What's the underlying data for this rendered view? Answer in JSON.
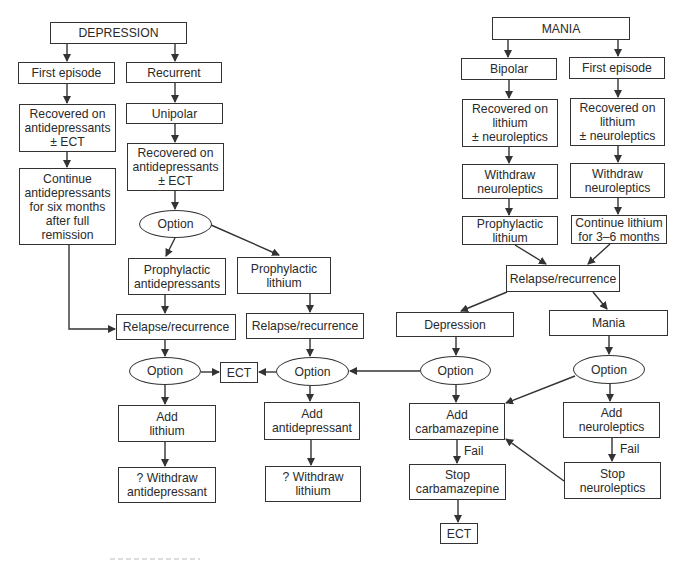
{
  "diagram": {
    "type": "flowchart",
    "nodes": {
      "depression": {
        "label": "DEPRESSION",
        "x": 50,
        "y": 22,
        "w": 137,
        "h": 22,
        "shape": "rect"
      },
      "dep_first_episode": {
        "label": "First episode",
        "x": 18,
        "y": 62,
        "w": 97,
        "h": 22,
        "shape": "rect"
      },
      "dep_recurrent": {
        "label": "Recurrent",
        "x": 126,
        "y": 62,
        "w": 96,
        "h": 21,
        "shape": "rect"
      },
      "dep_recovered_first": {
        "label": "Recovered on\nantidepressants\n± ECT",
        "x": 19,
        "y": 104,
        "w": 97,
        "h": 48,
        "shape": "rect"
      },
      "dep_unipolar": {
        "label": "Unipolar",
        "x": 126,
        "y": 103,
        "w": 97,
        "h": 21,
        "shape": "rect"
      },
      "dep_continue": {
        "label": "Continue\nantidepressants\nfor six months\nafter full\nremission",
        "x": 19,
        "y": 168,
        "w": 97,
        "h": 77,
        "shape": "rect"
      },
      "dep_recovered_recurrent": {
        "label": "Recovered on\nantidepressants\n± ECT",
        "x": 127,
        "y": 143,
        "w": 97,
        "h": 48,
        "shape": "rect"
      },
      "option_1": {
        "label": "Option",
        "x": 139,
        "y": 210,
        "w": 73,
        "h": 27,
        "shape": "ellipse"
      },
      "prophylactic_antidepressants": {
        "label": "Prophylactic\nantidepressants",
        "x": 128,
        "y": 258,
        "w": 98,
        "h": 37,
        "shape": "rect"
      },
      "prophylactic_lithium_dep": {
        "label": "Prophylactic\nlithium",
        "x": 237,
        "y": 257,
        "w": 94,
        "h": 37,
        "shape": "rect"
      },
      "relapse_left": {
        "label": "Relapse/recurrence",
        "x": 116,
        "y": 314,
        "w": 120,
        "h": 26,
        "shape": "rect"
      },
      "relapse_middle": {
        "label": "Relapse/recurrence",
        "x": 246,
        "y": 313,
        "w": 118,
        "h": 26,
        "shape": "rect"
      },
      "option_left": {
        "label": "Option",
        "x": 129,
        "y": 357,
        "w": 72,
        "h": 28,
        "shape": "ellipse"
      },
      "ect_middle": {
        "label": "ECT",
        "x": 220,
        "y": 362,
        "w": 38,
        "h": 21,
        "shape": "rect"
      },
      "option_middle": {
        "label": "Option",
        "x": 276,
        "y": 357,
        "w": 73,
        "h": 29,
        "shape": "ellipse"
      },
      "add_lithium": {
        "label": "Add\nlithium",
        "x": 118,
        "y": 405,
        "w": 98,
        "h": 37,
        "shape": "rect"
      },
      "add_antidepressant": {
        "label": "Add\nantidepressant",
        "x": 264,
        "y": 402,
        "w": 96,
        "h": 38,
        "shape": "rect"
      },
      "withdraw_antidepressant": {
        "label": "? Withdraw\nantidepressant",
        "x": 118,
        "y": 467,
        "w": 98,
        "h": 36,
        "shape": "rect"
      },
      "withdraw_lithium": {
        "label": "? Withdraw\nlithium",
        "x": 265,
        "y": 466,
        "w": 96,
        "h": 36,
        "shape": "rect"
      },
      "mania": {
        "label": "MANIA",
        "x": 492,
        "y": 17,
        "w": 138,
        "h": 23,
        "shape": "rect"
      },
      "mania_bipolar": {
        "label": "Bipolar",
        "x": 461,
        "y": 58,
        "w": 96,
        "h": 22,
        "shape": "rect"
      },
      "mania_first_episode": {
        "label": "First episode",
        "x": 569,
        "y": 57,
        "w": 96,
        "h": 22,
        "shape": "rect"
      },
      "mania_recovered_bipolar": {
        "label": "Recovered on\nlithium\n± neuroleptics",
        "x": 462,
        "y": 99,
        "w": 96,
        "h": 48,
        "shape": "rect"
      },
      "mania_recovered_first": {
        "label": "Recovered on\nlithium\n± neuroleptics",
        "x": 570,
        "y": 98,
        "w": 95,
        "h": 48,
        "shape": "rect"
      },
      "withdraw_neuroleptics_left": {
        "label": "Withdraw\nneuroleptics",
        "x": 462,
        "y": 164,
        "w": 96,
        "h": 35,
        "shape": "rect"
      },
      "withdraw_neuroleptics_right": {
        "label": "Withdraw\nneuroleptics",
        "x": 570,
        "y": 163,
        "w": 95,
        "h": 35,
        "shape": "rect"
      },
      "prophylactic_lithium_mania": {
        "label": "Prophylactic\nlithium",
        "x": 462,
        "y": 216,
        "w": 96,
        "h": 29,
        "shape": "rect"
      },
      "continue_lithium": {
        "label": "Continue lithium\nfor 3–6 months",
        "x": 571,
        "y": 215,
        "w": 96,
        "h": 29,
        "shape": "rect"
      },
      "relapse_right": {
        "label": "Relapse/recurrence",
        "x": 506,
        "y": 265,
        "w": 114,
        "h": 27,
        "shape": "rect"
      },
      "mania_depression": {
        "label": "Depression",
        "x": 396,
        "y": 312,
        "w": 118,
        "h": 25,
        "shape": "rect"
      },
      "mania_mania": {
        "label": "Mania",
        "x": 549,
        "y": 310,
        "w": 119,
        "h": 26,
        "shape": "rect"
      },
      "option_dep": {
        "label": "Option",
        "x": 420,
        "y": 356,
        "w": 71,
        "h": 29,
        "shape": "ellipse"
      },
      "option_mania": {
        "label": "Option",
        "x": 573,
        "y": 355,
        "w": 72,
        "h": 29,
        "shape": "ellipse"
      },
      "add_carbamazepine": {
        "label": "Add\ncarbamazepine",
        "x": 409,
        "y": 403,
        "w": 96,
        "h": 37,
        "shape": "rect"
      },
      "add_neuroleptics": {
        "label": "Add\nneuroleptics",
        "x": 563,
        "y": 402,
        "w": 97,
        "h": 36,
        "shape": "rect"
      },
      "stop_carbamazepine": {
        "label": "Stop\ncarbamazepine",
        "x": 409,
        "y": 464,
        "w": 97,
        "h": 36,
        "shape": "rect"
      },
      "stop_neuroleptics": {
        "label": "Stop\nneuroleptics",
        "x": 564,
        "y": 462,
        "w": 97,
        "h": 37,
        "shape": "rect"
      },
      "ect_bottom": {
        "label": "ECT",
        "x": 440,
        "y": 523,
        "w": 38,
        "h": 21,
        "shape": "rect"
      }
    },
    "edge_labels": {
      "fail_carbamazepine": "Fail",
      "fail_neuroleptics": "Fail"
    },
    "edges": [
      [
        "depression",
        "dep_first_episode"
      ],
      [
        "depression",
        "dep_recurrent"
      ],
      [
        "dep_first_episode",
        "dep_recovered_first"
      ],
      [
        "dep_recovered_first",
        "dep_continue"
      ],
      [
        "dep_continue",
        "relapse_left"
      ],
      [
        "dep_recurrent",
        "dep_unipolar"
      ],
      [
        "dep_unipolar",
        "dep_recovered_recurrent"
      ],
      [
        "dep_recovered_recurrent",
        "option_1"
      ],
      [
        "option_1",
        "prophylactic_antidepressants"
      ],
      [
        "option_1",
        "prophylactic_lithium_dep"
      ],
      [
        "prophylactic_antidepressants",
        "relapse_left"
      ],
      [
        "prophylactic_lithium_dep",
        "relapse_middle"
      ],
      [
        "relapse_left",
        "option_left"
      ],
      [
        "relapse_middle",
        "option_middle"
      ],
      [
        "option_left",
        "ect_middle"
      ],
      [
        "option_middle",
        "ect_middle"
      ],
      [
        "option_left",
        "add_lithium"
      ],
      [
        "add_lithium",
        "withdraw_antidepressant"
      ],
      [
        "option_middle",
        "add_antidepressant"
      ],
      [
        "add_antidepressant",
        "withdraw_lithium"
      ],
      [
        "mania",
        "mania_bipolar"
      ],
      [
        "mania",
        "mania_first_episode"
      ],
      [
        "mania_bipolar",
        "mania_recovered_bipolar"
      ],
      [
        "mania_first_episode",
        "mania_recovered_first"
      ],
      [
        "mania_recovered_bipolar",
        "withdraw_neuroleptics_left"
      ],
      [
        "mania_recovered_first",
        "withdraw_neuroleptics_right"
      ],
      [
        "withdraw_neuroleptics_left",
        "prophylactic_lithium_mania"
      ],
      [
        "withdraw_neuroleptics_right",
        "continue_lithium"
      ],
      [
        "prophylactic_lithium_mania",
        "relapse_right"
      ],
      [
        "continue_lithium",
        "relapse_right"
      ],
      [
        "relapse_right",
        "mania_depression"
      ],
      [
        "relapse_right",
        "mania_mania"
      ],
      [
        "mania_depression",
        "option_dep"
      ],
      [
        "mania_mania",
        "option_mania"
      ],
      [
        "option_dep",
        "option_middle"
      ],
      [
        "option_dep",
        "add_carbamazepine"
      ],
      [
        "option_mania",
        "add_carbamazepine"
      ],
      [
        "option_mania",
        "add_neuroleptics"
      ],
      [
        "add_carbamazepine",
        "stop_carbamazepine",
        "Fail"
      ],
      [
        "add_neuroleptics",
        "stop_neuroleptics",
        "Fail"
      ],
      [
        "stop_neuroleptics",
        "add_carbamazepine"
      ],
      [
        "stop_carbamazepine",
        "ect_bottom"
      ]
    ]
  },
  "colors": {
    "line": "#333333",
    "text": "#2a2a2a",
    "background": "#ffffff"
  }
}
